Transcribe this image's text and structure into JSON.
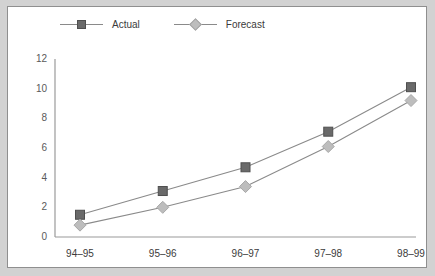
{
  "chart_data": {
    "type": "line",
    "title": "",
    "xlabel": "",
    "ylabel": "",
    "categories": [
      "94–95",
      "95–96",
      "96–97",
      "97–98",
      "98–99"
    ],
    "series": [
      {
        "name": "Actual",
        "marker": "square",
        "color": "#6a6a6a",
        "values": [
          1.5,
          3.1,
          4.7,
          7.1,
          10.1
        ]
      },
      {
        "name": "Forecast",
        "marker": "diamond",
        "color": "#bdbdbd",
        "values": [
          0.8,
          2.0,
          3.4,
          6.1,
          9.2
        ]
      }
    ],
    "ylim": [
      0,
      12
    ],
    "yticks": [
      0,
      2,
      4,
      6,
      8,
      10,
      12
    ],
    "ytick_labels": [
      "0",
      "2",
      "4",
      "6",
      "8",
      "10",
      "12"
    ],
    "grid": false,
    "legend_position": "top-left",
    "line_color": "#8a8a8a",
    "axis_color": "#9a9a9a",
    "background": "#ffffff",
    "frame_color": "#d2d2d2"
  },
  "legend": {
    "items": [
      {
        "label": "Actual"
      },
      {
        "label": "Forecast"
      }
    ]
  }
}
